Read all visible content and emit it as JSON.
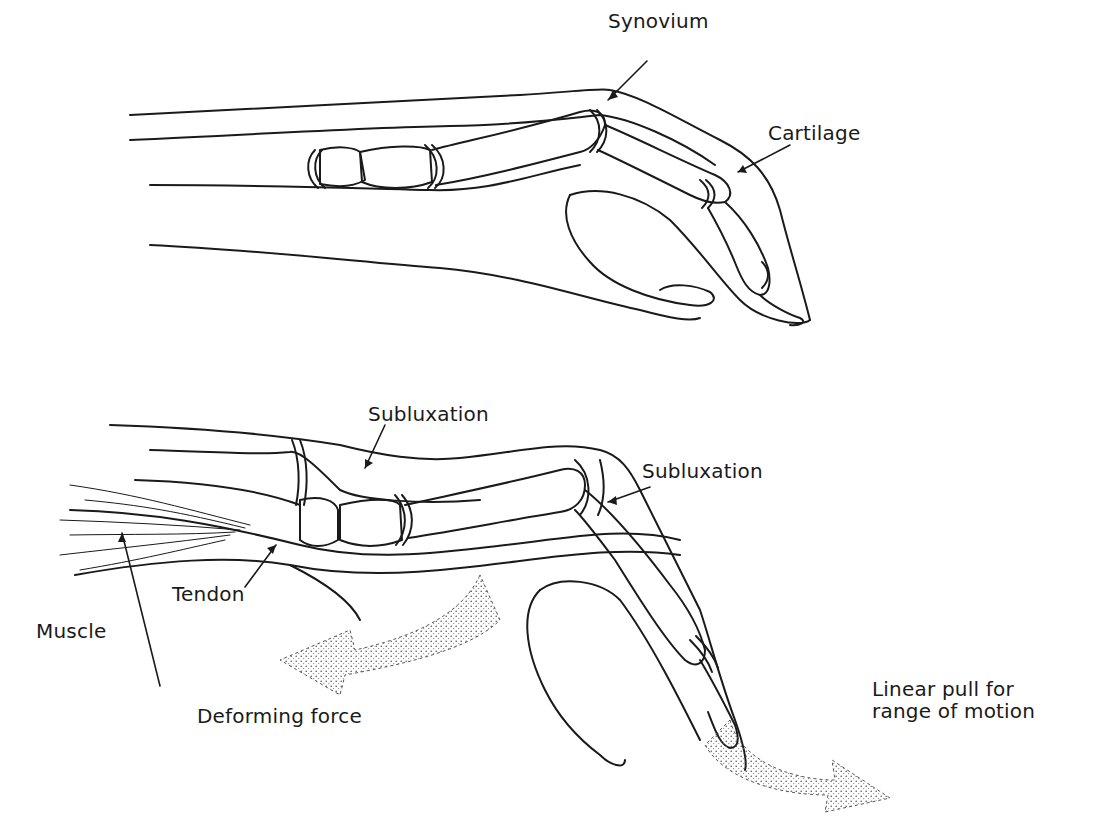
{
  "figure": {
    "top_panel": {
      "description": "Normal finger joint (side view)",
      "labels": [
        {
          "id": "synovium",
          "text": "Synovium"
        },
        {
          "id": "cartilage",
          "text": "Cartilage"
        }
      ]
    },
    "bottom_panel": {
      "description": "Finger with joint subluxation and deforming force",
      "labels": [
        {
          "id": "subluxation_1",
          "text": "Subluxation"
        },
        {
          "id": "subluxation_2",
          "text": "Subluxation"
        },
        {
          "id": "tendon",
          "text": "Tendon"
        },
        {
          "id": "muscle",
          "text": "Muscle"
        },
        {
          "id": "deforming_force",
          "text": "Deforming force"
        },
        {
          "id": "linear_pull",
          "text": "Linear pull for\nrange of motion"
        }
      ]
    },
    "colors": {
      "line": "#1a1a1a",
      "stipple": "#555555",
      "background": "#ffffff"
    }
  }
}
